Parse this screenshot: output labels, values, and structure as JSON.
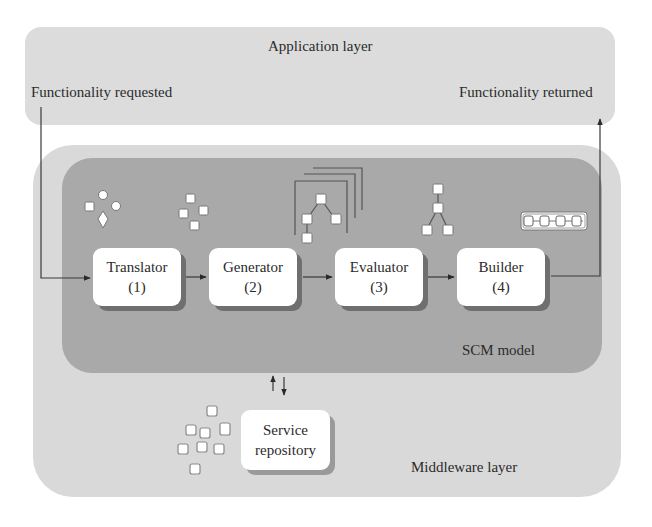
{
  "diagram": {
    "application_layer": {
      "title": "Application layer",
      "input_label": "Functionality requested",
      "output_label": "Functionality returned"
    },
    "middleware_layer": {
      "title": "Middleware layer"
    },
    "scm_model": {
      "title": "SCM model",
      "components": [
        {
          "name": "Translator",
          "step": "(1)",
          "icon": "mixed-shapes-icon"
        },
        {
          "name": "Generator",
          "step": "(2)",
          "icon": "scattered-squares-icon"
        },
        {
          "name": "Evaluator",
          "step": "(3)",
          "icon": "stacked-trees-icon"
        },
        {
          "name": "Builder",
          "step": "(4)",
          "icon": "single-tree-icon"
        }
      ],
      "output_icon": "linked-chain-icon"
    },
    "service_repository": {
      "line1": "Service",
      "line2": "repository",
      "icon": "service-squares-icon"
    },
    "colors": {
      "application_layer_bg": "#dcdcdc",
      "middleware_layer_bg": "#d9d9d9",
      "scm_model_bg": "#a9a9a9",
      "box_bg": "#ffffff",
      "line": "#3a3a3a"
    }
  }
}
